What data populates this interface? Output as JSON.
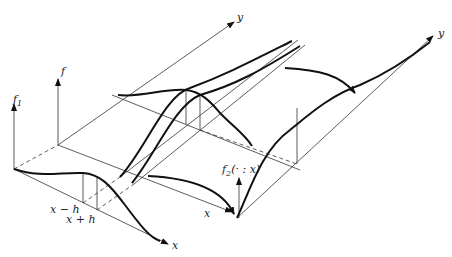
{
  "labels": {
    "f1": "f",
    "f1_sub": "1",
    "f": "f",
    "y_left": "y",
    "y_right": "y",
    "x_bottom": "x",
    "x_mid": "x",
    "x_minus_h": "x − h",
    "x_plus_h": "x + h",
    "f2": "f",
    "f2_sub": "2",
    "f2_args": "(· : x)"
  },
  "colors": {
    "ink": "#111111",
    "background": "#ffffff"
  }
}
